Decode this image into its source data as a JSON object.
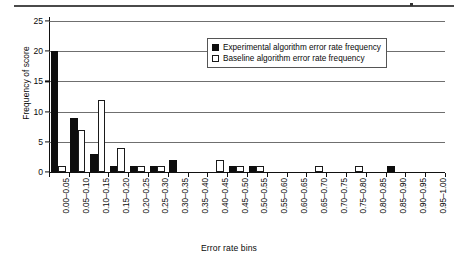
{
  "figure": {
    "top_rule": "horizontal-rule",
    "x_axis_title": "Error rate bins",
    "y_axis_title": "Frequency of score"
  },
  "legend": {
    "position": "top-right-inside",
    "entries": [
      {
        "label": "Experimental algorithm error rate frequency",
        "swatch": "filled-black-square"
      },
      {
        "label": "Baseline algorithm error rate frequency",
        "swatch": "open-white-square"
      }
    ]
  },
  "chart_data": {
    "type": "bar",
    "title": "",
    "subtitle": "",
    "xlabel": "Error rate bins",
    "ylabel": "Frequency of score",
    "ylim": [
      0,
      25
    ],
    "yticks": [
      0,
      5,
      10,
      15,
      20,
      25
    ],
    "grid": true,
    "grid_axis": "y",
    "legend_position": "top-right-inside",
    "categories": [
      "0.00–0.05",
      "0.05–0.10",
      "0.10–0.15",
      "0.15–0.20",
      "0.20–0.25",
      "0.25–0.30",
      "0.30–0.35",
      "0.35–0.40",
      "0.40–0.45",
      "0.45–0.50",
      "0.50–0.55",
      "0.55–0.60",
      "0.60–0.65",
      "0.65–0.70",
      "0.70–0.75",
      "0.75–0.80",
      "0.80–0.85",
      "0.85–0.90",
      "0.90–0.95",
      "0.95–1.00"
    ],
    "series": [
      {
        "name": "Experimental algorithm error rate frequency",
        "color": "#0d0d0d",
        "values": [
          20,
          9,
          3,
          1,
          1,
          1,
          2,
          0,
          0,
          1,
          1,
          0,
          0,
          0,
          0,
          0,
          0,
          1,
          0,
          0
        ]
      },
      {
        "name": "Baseline algorithm error rate frequency",
        "color": "#ffffff",
        "values": [
          1,
          7,
          12,
          4,
          1,
          1,
          0,
          0,
          2,
          1,
          1,
          0,
          0,
          1,
          0,
          1,
          0,
          0,
          0,
          0
        ]
      }
    ]
  }
}
